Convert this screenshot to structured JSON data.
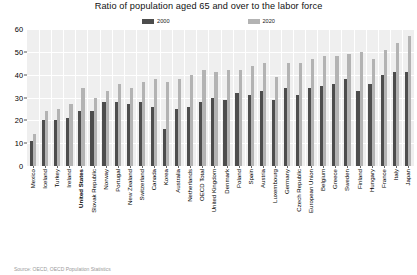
{
  "chart": {
    "title": "Ratio of population aged 65 and over to the labor force",
    "source_note": "Source: OECD, OECD Population Statistics"
  },
  "legend": {
    "position": "top-center",
    "entries": [
      {
        "label": "2000",
        "color": "#4d4d4d",
        "swatch_name": "legend-swatch-2000"
      },
      {
        "label": "2020",
        "color": "#b3b3b3",
        "swatch_name": "legend-swatch-2020"
      }
    ]
  },
  "axes": {
    "y_ticks": [
      "60",
      "50",
      "40",
      "30",
      "20",
      "10",
      "0"
    ],
    "x_highlight": "United States"
  },
  "chart_data": {
    "type": "bar",
    "title": "Ratio of population aged 65 and over to the labor force",
    "xlabel": "",
    "ylabel": "",
    "ylim": [
      0,
      60
    ],
    "yticks": [
      0,
      10,
      20,
      30,
      40,
      50,
      60
    ],
    "grid": true,
    "legend_position": "top-center",
    "categories": [
      "Mexico",
      "Iceland",
      "Turkey",
      "Ireland",
      "United States",
      "Slovak Republic",
      "Norway",
      "Portugal",
      "New Zealand",
      "Switzerland",
      "Canada",
      "Korea",
      "Australia",
      "Netherlands",
      "OECD Total",
      "United Kingdom",
      "Denmark",
      "Poland",
      "Spain",
      "Austria",
      "Luxembourg",
      "Germany",
      "Czech Republic",
      "European Union",
      "Belgium",
      "Greece",
      "Sweden",
      "Finland",
      "Hungary",
      "France",
      "Italy",
      "Japan"
    ],
    "series": [
      {
        "name": "2000",
        "color": "#4d4d4d",
        "values": [
          11,
          20,
          20,
          21,
          24,
          24,
          28,
          28,
          27,
          28,
          26,
          16,
          25,
          26,
          28,
          30,
          29,
          32,
          31,
          33,
          29,
          34,
          31,
          34,
          35,
          36,
          38,
          33,
          36,
          40,
          41,
          41
        ]
      },
      {
        "name": "2020",
        "color": "#b3b3b3",
        "values": [
          14,
          24,
          25,
          27,
          34,
          30,
          33,
          36,
          34,
          37,
          38,
          37,
          38,
          40,
          42,
          41,
          42,
          42,
          44,
          45,
          39,
          45,
          45,
          47,
          48,
          48,
          49,
          50,
          47,
          51,
          54,
          57
        ]
      }
    ]
  }
}
